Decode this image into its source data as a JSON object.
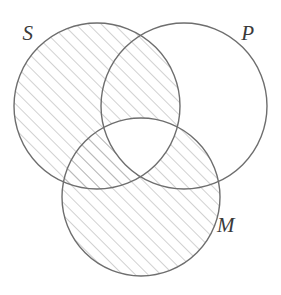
{
  "figure": {
    "name": "three-circle-venn-diagram",
    "type": "venn-diagram",
    "width": 281,
    "height": 295,
    "background_color": "#ffffff",
    "stroke_color": "#6e6e6e",
    "hatch_color": "#9a9a9a",
    "label_color": "#3a3a3a"
  },
  "circles": [
    {
      "id": "S",
      "label": "S",
      "cx": 97,
      "cy": 106,
      "r": 83,
      "label_x": 28,
      "label_y": 40
    },
    {
      "id": "P",
      "label": "P",
      "cx": 184,
      "cy": 106,
      "r": 83,
      "label_x": 248,
      "label_y": 40
    },
    {
      "id": "M",
      "label": "M",
      "cx": 141,
      "cy": 197,
      "r": 79,
      "label_x": 226,
      "label_y": 232
    }
  ],
  "shading": {
    "style": "diagonal-hatch",
    "direction": "bottom-left-to-top-right",
    "spacing_px": 9,
    "shaded_regions": [
      "S-only",
      "S-and-P-only",
      "S-and-M-only",
      "M-only",
      "M-and-P-only"
    ],
    "unshaded_regions": [
      "P-only",
      "S-and-P-and-M"
    ],
    "description": "The entire S circle and the entire M circle are shaded, except the central region where S, P and M all overlap, which is left blank."
  },
  "labels": {
    "subject": "S",
    "predicate": "P",
    "middle": "M"
  }
}
